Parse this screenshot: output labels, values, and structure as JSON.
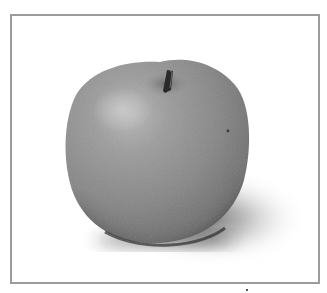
{
  "image": {
    "subject": "apple",
    "description": "Grayscale photograph of a single apple with stem, casting a soft shadow to the lower right, inside a gray rectangular frame",
    "colors": {
      "frame_border": "#9c9c9c",
      "background": "#ffffff",
      "apple_body": "#8a8a8a",
      "apple_highlight": "#b8b8b8",
      "apple_shade": "#5e5e5e",
      "stem": "#2a2a2a",
      "shadow": "#3a3a3a"
    }
  }
}
